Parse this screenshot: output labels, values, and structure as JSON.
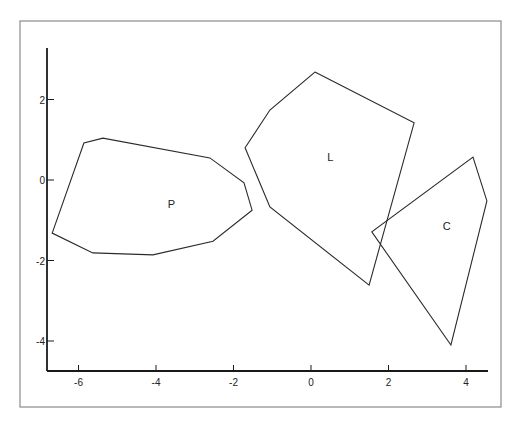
{
  "chart_data": {
    "type": "scatter",
    "subtype": "polygon-outlines",
    "title": "",
    "xlabel": "",
    "ylabel": "",
    "xlim": [
      -7,
      4.6
    ],
    "ylim": [
      -4.8,
      3.3
    ],
    "grid": false,
    "legend": null,
    "x_ticks": [
      -6,
      -4,
      -2,
      0,
      2,
      4
    ],
    "x_tick_labels": [
      "-6",
      "-4",
      "-2",
      "0",
      "2",
      "4"
    ],
    "y_ticks": [
      -4,
      -2,
      0,
      2
    ],
    "y_tick_labels": [
      "-4",
      "-2",
      "0",
      "2"
    ],
    "series": [
      {
        "name": "P",
        "label_position": [
          -3.6,
          -0.6
        ],
        "points": [
          [
            -6.68,
            -1.32
          ],
          [
            -5.86,
            0.92
          ],
          [
            -5.37,
            1.04
          ],
          [
            -2.61,
            0.55
          ],
          [
            -1.73,
            -0.07
          ],
          [
            -1.52,
            -0.75
          ],
          [
            -2.53,
            -1.52
          ],
          [
            -4.08,
            -1.86
          ],
          [
            -5.63,
            -1.81
          ]
        ]
      },
      {
        "name": "L",
        "label_position": [
          0.5,
          0.56
        ],
        "points": [
          [
            0.1,
            2.68
          ],
          [
            2.66,
            1.42
          ],
          [
            1.5,
            -2.61
          ],
          [
            -1.06,
            -0.67
          ],
          [
            -1.7,
            0.8
          ],
          [
            -1.06,
            1.74
          ]
        ]
      },
      {
        "name": "C",
        "label_position": [
          3.5,
          -1.15
        ],
        "points": [
          [
            4.18,
            0.57
          ],
          [
            4.54,
            -0.52
          ],
          [
            3.61,
            -4.1
          ],
          [
            1.57,
            -1.29
          ]
        ]
      }
    ]
  },
  "layout": {
    "frame": {
      "x": 20,
      "y": 21,
      "w": 481,
      "h": 386
    },
    "x_origin_px": 311,
    "x_px_per_unit": 38.75,
    "y_origin_px": 180,
    "y_px_per_unit": 40.25,
    "x_axis_px": {
      "y": 371,
      "x1": 47,
      "x2": 488
    },
    "y_axis_px": {
      "x": 47,
      "y1": 48,
      "y2": 371
    }
  }
}
